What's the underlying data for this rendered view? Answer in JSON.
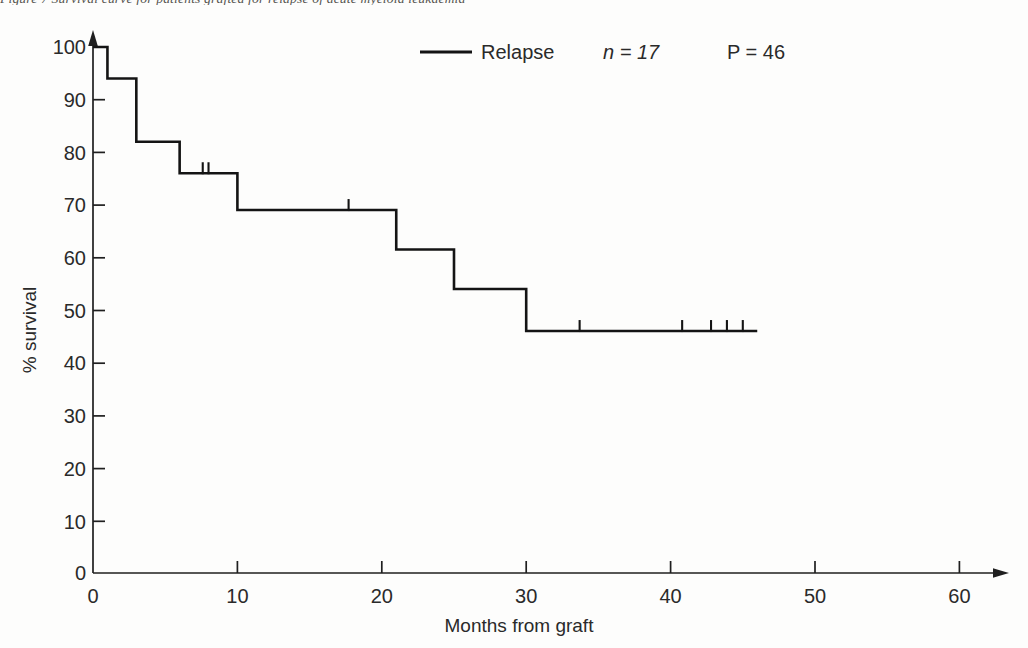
{
  "figure": {
    "caption_sliver": "Figure 7 Survival curve for patients grafted for relapse of acute myeloid leukaemia"
  },
  "legend": {
    "series_label": "Relapse",
    "n_label": "n = 17",
    "p_label": "P = 46",
    "line_color": "#141414"
  },
  "axes": {
    "x_title": "Months from graft",
    "y_title": "% survival",
    "x_ticks": [
      "0",
      "10",
      "20",
      "30",
      "40",
      "50",
      "60"
    ],
    "y_ticks": [
      "0",
      "10",
      "20",
      "30",
      "40",
      "50",
      "60",
      "70",
      "80",
      "90",
      "100"
    ]
  },
  "chart_data": {
    "type": "line",
    "subtype": "kaplan-meier-step",
    "title": "",
    "subtitle": "",
    "xlabel": "Months from graft",
    "ylabel": "% survival",
    "xlim": [
      0,
      60
    ],
    "ylim": [
      0,
      100
    ],
    "x_ticks": [
      0,
      10,
      20,
      30,
      40,
      50,
      60
    ],
    "y_ticks": [
      0,
      10,
      20,
      30,
      40,
      50,
      60,
      70,
      80,
      90,
      100
    ],
    "grid": false,
    "legend_position": "top-center",
    "series": [
      {
        "name": "Relapse",
        "n": 17,
        "plateau_percent": 46,
        "color": "#141414",
        "step_points": [
          {
            "x": 0.0,
            "y": 100
          },
          {
            "x": 1.0,
            "y": 100
          },
          {
            "x": 1.0,
            "y": 94
          },
          {
            "x": 3.0,
            "y": 94
          },
          {
            "x": 3.0,
            "y": 82
          },
          {
            "x": 6.0,
            "y": 82
          },
          {
            "x": 6.0,
            "y": 76
          },
          {
            "x": 10.0,
            "y": 76
          },
          {
            "x": 10.0,
            "y": 69
          },
          {
            "x": 21.0,
            "y": 69
          },
          {
            "x": 21.0,
            "y": 61.5
          },
          {
            "x": 25.0,
            "y": 61.5
          },
          {
            "x": 25.0,
            "y": 54
          },
          {
            "x": 30.0,
            "y": 54
          },
          {
            "x": 30.0,
            "y": 46
          },
          {
            "x": 46.0,
            "y": 46
          }
        ],
        "censored_points": [
          {
            "x": 7.6,
            "y": 76
          },
          {
            "x": 8.0,
            "y": 76
          },
          {
            "x": 17.7,
            "y": 69
          },
          {
            "x": 33.7,
            "y": 46
          },
          {
            "x": 40.8,
            "y": 46
          },
          {
            "x": 42.8,
            "y": 46
          },
          {
            "x": 43.9,
            "y": 46
          },
          {
            "x": 45.0,
            "y": 46
          }
        ]
      }
    ]
  }
}
